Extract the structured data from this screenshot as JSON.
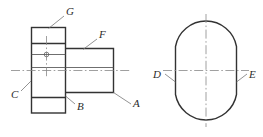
{
  "drawing": {
    "title": "Two-view orthographic engineering drawing of a flanged shaft",
    "background_color": "#ffffff",
    "outline_color": "#333333",
    "thin_line_color": "#555555",
    "center_line_color": "#888888",
    "leader_color": "#777777",
    "label_color": "#2b2b2b",
    "views": [
      {
        "name": "front-elevation-view",
        "description": "Flange block on the left with a stepped cylindrical shaft extending to the right"
      },
      {
        "name": "side-end-view",
        "description": "Circle with two vertical flats on the left and right sides"
      }
    ]
  },
  "labels": {
    "g": "G",
    "f": "F",
    "c": "C",
    "b": "B",
    "a": "A",
    "d": "D",
    "e": "E"
  }
}
